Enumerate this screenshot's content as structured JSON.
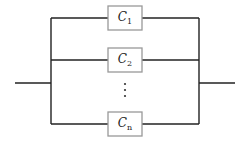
{
  "diagram": {
    "components": [
      {
        "label": "C",
        "subscript": "1"
      },
      {
        "label": "C",
        "subscript": "2"
      },
      {
        "label": "C",
        "subscript": "n"
      }
    ],
    "ellipsis": "⋮",
    "colors": {
      "wire": "#222222",
      "box_border": "#999999"
    }
  }
}
